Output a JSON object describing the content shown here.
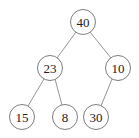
{
  "diagram": {
    "type": "binary-tree",
    "nodes": [
      {
        "id": "n40",
        "label": "40",
        "x": 83,
        "y": 22
      },
      {
        "id": "n23",
        "label": "23",
        "x": 50,
        "y": 68
      },
      {
        "id": "n10",
        "label": "10",
        "x": 118,
        "y": 68
      },
      {
        "id": "n15",
        "label": "15",
        "x": 22,
        "y": 117
      },
      {
        "id": "n8",
        "label": "8",
        "x": 65,
        "y": 117
      },
      {
        "id": "n30",
        "label": "30",
        "x": 96,
        "y": 117
      }
    ],
    "edges": [
      {
        "from": "40",
        "to": "23"
      },
      {
        "from": "40",
        "to": "10"
      },
      {
        "from": "23",
        "to": "15"
      },
      {
        "from": "23",
        "to": "8"
      },
      {
        "from": "10",
        "to": "30"
      }
    ],
    "node_radius": 12.5,
    "colors": {
      "stroke": "#6e6e6e",
      "edge": "#8a8a8a",
      "text": "#222222",
      "fill": "#ffffff"
    }
  }
}
